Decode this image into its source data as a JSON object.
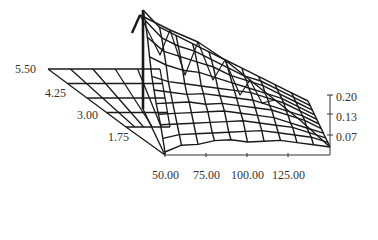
{
  "chart_data": {
    "type": "surface3d-wireframe",
    "title": "",
    "xlabel": "",
    "ylabel": "",
    "zlabel": "",
    "x_ticks": [
      "50.00",
      "75.00",
      "100.00",
      "125.00"
    ],
    "depth_ticks": [
      "5.50",
      "4.25",
      "3.00",
      "1.75"
    ],
    "z_ticks": [
      "0.20",
      "0.13",
      "0.07"
    ],
    "x_range": [
      50,
      150
    ],
    "depth_range": [
      1.75,
      5.5
    ],
    "z_range": [
      0,
      0.2
    ],
    "grid": false,
    "legend": "none",
    "x": [
      50,
      60,
      70,
      80,
      90,
      100,
      110,
      120,
      130,
      140,
      150
    ],
    "depth": [
      1.75,
      2.125,
      2.5,
      2.875,
      3.25,
      3.625,
      4.0,
      4.375,
      4.75,
      5.125,
      5.5
    ],
    "z": [
      [
        0.01,
        0.03,
        0.03,
        0.04,
        0.04,
        0.03,
        0.03,
        0.03,
        0.02,
        0.01,
        0.0
      ],
      [
        0.04,
        0.05,
        0.05,
        0.05,
        0.05,
        0.05,
        0.05,
        0.04,
        0.03,
        0.02,
        0.0
      ],
      [
        0.07,
        0.07,
        0.07,
        0.07,
        0.07,
        0.07,
        0.06,
        0.05,
        0.04,
        0.02,
        0.0
      ],
      [
        0.09,
        0.09,
        0.09,
        0.09,
        0.09,
        0.08,
        0.07,
        0.06,
        0.04,
        0.02,
        0.0
      ],
      [
        0.11,
        0.11,
        0.11,
        0.1,
        0.1,
        0.09,
        0.08,
        0.07,
        0.05,
        0.03,
        0.0
      ],
      [
        0.14,
        0.13,
        0.12,
        0.12,
        0.11,
        0.1,
        0.09,
        0.07,
        0.05,
        0.03,
        0.0
      ],
      [
        0.17,
        0.15,
        0.14,
        0.13,
        0.12,
        0.11,
        0.1,
        0.08,
        0.06,
        0.03,
        0.0
      ],
      [
        0.22,
        0.19,
        0.17,
        0.16,
        0.14,
        0.12,
        0.1,
        0.08,
        0.06,
        0.03,
        0.0
      ],
      [
        0.27,
        0.22,
        0.2,
        0.18,
        0.16,
        0.13,
        0.11,
        0.09,
        0.06,
        0.03,
        0.0
      ],
      [
        0.31,
        0.25,
        0.22,
        0.2,
        0.17,
        0.14,
        0.11,
        0.09,
        0.06,
        0.03,
        0.0
      ],
      [
        0.33,
        0.27,
        0.24,
        0.21,
        0.18,
        0.15,
        0.12,
        0.09,
        0.06,
        0.03,
        0.0
      ]
    ],
    "back_flat_plane": {
      "description": "flat zero-height grid extending to the left behind the surface",
      "columns": 5,
      "rows": 4
    }
  },
  "colors": {
    "line": "#1a1a1a",
    "axis": "#333333",
    "label": "#333333",
    "background": "#ffffff"
  }
}
